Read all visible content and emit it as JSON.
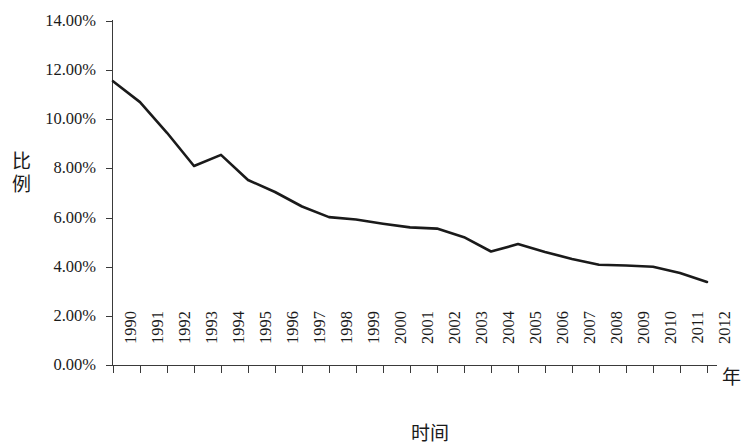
{
  "chart_data": {
    "type": "line",
    "title": "",
    "xlabel": "时间",
    "ylabel": "比例",
    "x_unit_label": "年",
    "categories": [
      "1990",
      "1991",
      "1992",
      "1993",
      "1994",
      "1995",
      "1996",
      "1997",
      "1998",
      "1999",
      "2000",
      "2001",
      "2002",
      "2003",
      "2004",
      "2005",
      "2006",
      "2007",
      "2008",
      "2009",
      "2010",
      "2011",
      "2012"
    ],
    "values": [
      11.55,
      10.7,
      9.45,
      8.1,
      8.55,
      7.53,
      7.04,
      6.45,
      6.02,
      5.92,
      5.75,
      5.6,
      5.55,
      5.2,
      4.62,
      4.92,
      4.6,
      4.32,
      4.08,
      4.05,
      4.0,
      3.75,
      3.38
    ],
    "value_unit": "%",
    "ylim": [
      0,
      14
    ],
    "ytick_values": [
      14,
      12,
      10,
      8,
      6,
      4,
      2,
      0
    ],
    "ytick_labels": [
      "14.00%",
      "12.00%",
      "10.00%",
      "8.00%",
      "6.00%",
      "4.00%",
      "2.00%",
      "0.00%"
    ],
    "xlim": [
      "1990",
      "2012"
    ],
    "grid": false,
    "legend": null,
    "series_color": "#1a1a1a",
    "axis_color": "#3a3a3a",
    "line_width": 2.6,
    "markers": false,
    "annotations": []
  }
}
